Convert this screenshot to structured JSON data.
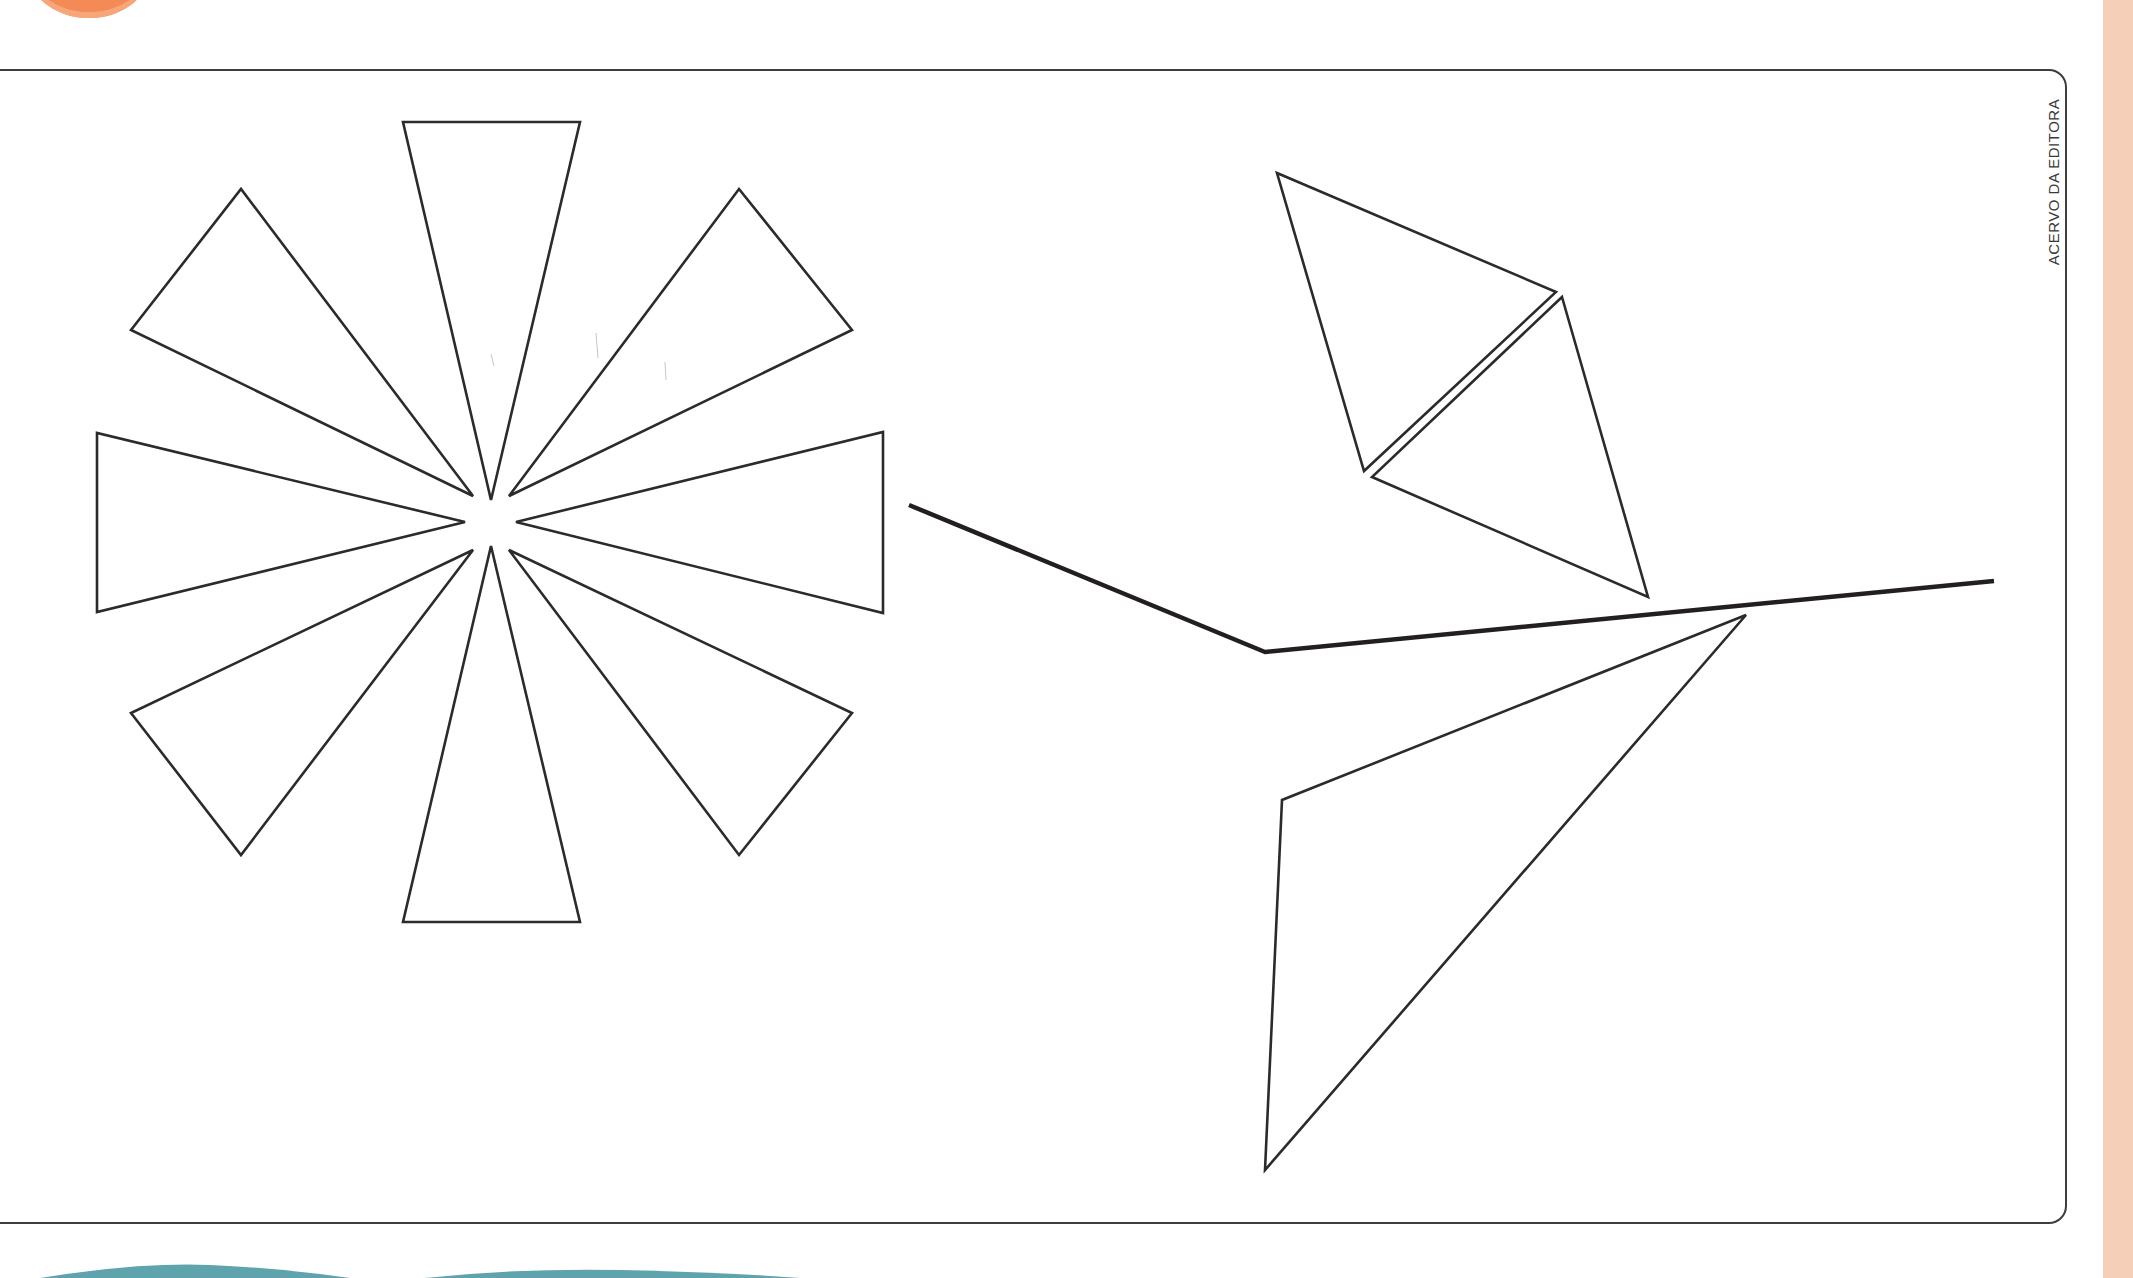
{
  "credit": {
    "label": "ACERVO DA EDITORA"
  },
  "colors": {
    "outline": "#2b2b2b",
    "stem": "#231f20",
    "frame": "#3d3d3d",
    "peach": "#f6cfb8",
    "orange": "#f48a55",
    "orange_light": "#f7a67a",
    "teal": "#5fa3ad"
  },
  "figures": {
    "flower": {
      "description": "Flower made of 8 triangular petals around a center",
      "center": [
        491,
        522
      ],
      "petals": [
        {
          "name": "top",
          "points": [
            [
              403,
              122
            ],
            [
              580,
              122
            ],
            [
              491,
              500
            ]
          ]
        },
        {
          "name": "top-right",
          "points": [
            [
              739,
              189
            ],
            [
              852,
              330
            ],
            [
              509,
              496
            ]
          ]
        },
        {
          "name": "right",
          "points": [
            [
              883,
              432
            ],
            [
              883,
              613
            ],
            [
              516,
              522
            ]
          ]
        },
        {
          "name": "bottom-right",
          "points": [
            [
              852,
              713
            ],
            [
              739,
              855
            ],
            [
              509,
              550
            ]
          ]
        },
        {
          "name": "bottom",
          "points": [
            [
              403,
              922
            ],
            [
              580,
              922
            ],
            [
              491,
              546
            ]
          ]
        },
        {
          "name": "bottom-left",
          "points": [
            [
              131,
              713
            ],
            [
              241,
              855
            ],
            [
              473,
              550
            ]
          ]
        },
        {
          "name": "left",
          "points": [
            [
              97,
              433
            ],
            [
              97,
              612
            ],
            [
              465,
              522
            ]
          ]
        },
        {
          "name": "top-left",
          "points": [
            [
              131,
              330
            ],
            [
              241,
              189
            ],
            [
              473,
              496
            ]
          ]
        }
      ]
    },
    "stem": {
      "points": [
        [
          909,
          505
        ],
        [
          1265,
          652
        ],
        [
          1994,
          581
        ]
      ]
    },
    "leaves": [
      {
        "name": "upper-leaf-a",
        "points": [
          [
            1277,
            173
          ],
          [
            1556,
            292
          ],
          [
            1364,
            471
          ]
        ]
      },
      {
        "name": "upper-leaf-b",
        "points": [
          [
            1562,
            297
          ],
          [
            1648,
            597
          ],
          [
            1372,
            477
          ]
        ]
      },
      {
        "name": "lower-leaf",
        "points": [
          [
            1746,
            615
          ],
          [
            1282,
            800
          ],
          [
            1265,
            1170
          ]
        ]
      }
    ]
  }
}
